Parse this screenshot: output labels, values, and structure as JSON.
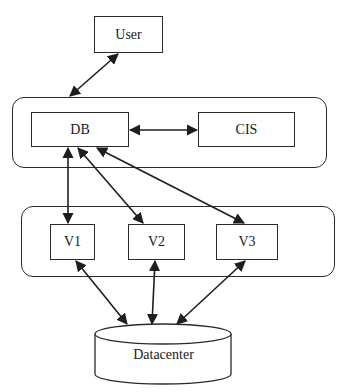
{
  "diagram": {
    "type": "architecture-block-diagram",
    "nodes": {
      "user": {
        "label": "User"
      },
      "db": {
        "label": "DB"
      },
      "cis": {
        "label": "CIS"
      },
      "v1": {
        "label": "V1"
      },
      "v2": {
        "label": "V2"
      },
      "v3": {
        "label": "V3"
      },
      "datacenter": {
        "label": "Datacenter",
        "shape": "cylinder"
      }
    },
    "groups": [
      {
        "id": "upper-group",
        "members": [
          "DB",
          "CIS"
        ]
      },
      {
        "id": "vm-group",
        "members": [
          "V1",
          "V2",
          "V3"
        ]
      }
    ],
    "edges": [
      {
        "from": "User",
        "to": "upper-group",
        "direction": "bidirectional"
      },
      {
        "from": "DB",
        "to": "CIS",
        "direction": "bidirectional"
      },
      {
        "from": "DB",
        "to": "V1",
        "direction": "bidirectional"
      },
      {
        "from": "DB",
        "to": "V2",
        "direction": "bidirectional"
      },
      {
        "from": "DB",
        "to": "V3",
        "direction": "bidirectional"
      },
      {
        "from": "V1",
        "to": "Datacenter",
        "direction": "bidirectional"
      },
      {
        "from": "V2",
        "to": "Datacenter",
        "direction": "bidirectional"
      },
      {
        "from": "V3",
        "to": "Datacenter",
        "direction": "bidirectional"
      }
    ],
    "colors": {
      "stroke": "#2a2a2a",
      "background": "#ffffff",
      "text": "#1a1a1a"
    }
  }
}
